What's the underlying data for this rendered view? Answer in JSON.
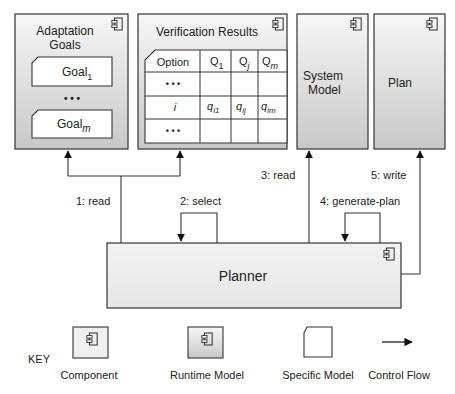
{
  "components": {
    "adaptation_goals": {
      "title_line1": "Adaptation",
      "title_line2": "Goals",
      "goal_first": "Goal",
      "goal_first_sub": "1",
      "ellipsis": "• • •",
      "goal_last": "Goal",
      "goal_last_sub": "m"
    },
    "verification_results": {
      "title": "Verification Results",
      "table": {
        "headers": [
          {
            "main": "Option",
            "sub": ""
          },
          {
            "main": "Q",
            "sub": "1"
          },
          {
            "main": "Q",
            "sub": "j"
          },
          {
            "main": "Q",
            "sub": "m"
          }
        ],
        "rows": [
          [
            "• • •",
            "",
            "",
            ""
          ],
          [
            "i",
            "q_i1",
            "q_ij",
            "q_im"
          ],
          [
            "• • •",
            "",
            "",
            ""
          ]
        ],
        "row_i": {
          "label": "i",
          "c1_main": "q",
          "c1_sub": "i1",
          "c2_main": "q",
          "c2_sub": "ij",
          "c3_main": "q",
          "c3_sub": "im"
        }
      }
    },
    "system_model": {
      "title_line1": "System",
      "title_line2": "Model"
    },
    "plan": {
      "title": "Plan"
    },
    "planner": {
      "title": "Planner"
    }
  },
  "flows": [
    {
      "label": "1: read"
    },
    {
      "label": "2: select"
    },
    {
      "label": "3: read"
    },
    {
      "label": "4: generate-plan"
    },
    {
      "label": "5: write"
    }
  ],
  "key": {
    "title": "KEY",
    "items": [
      {
        "label": "Component"
      },
      {
        "label": "Runtime Model"
      },
      {
        "label": "Specific Model"
      },
      {
        "label": "Control Flow"
      }
    ]
  },
  "colors": {
    "stroke": "#333333",
    "runtime_fill_top": "#f4f4f4",
    "runtime_fill_bottom": "#c9c9c9",
    "component_fill": "#eeeeee"
  }
}
